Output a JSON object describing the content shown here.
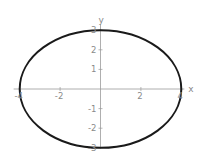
{
  "chart_data": {
    "type": "line",
    "title": "",
    "xlabel": "x",
    "ylabel": "y",
    "xlim": [
      -4,
      4
    ],
    "ylim": [
      -3,
      3
    ],
    "grid": false,
    "legend": null,
    "x_ticks": [
      -4,
      -2,
      2,
      4
    ],
    "x_tick_labels": [
      "-4",
      "-2",
      "2",
      "4"
    ],
    "y_ticks": [
      -3,
      -2,
      -1,
      1,
      2,
      3
    ],
    "y_tick_labels": [
      "-3",
      "-2",
      "-1",
      "1",
      "2",
      "3"
    ],
    "series": [
      {
        "name": "ellipse",
        "description": "x^2/16 + y^2/9 = 1",
        "semi_axis_x": 4,
        "semi_axis_y": 3,
        "center": [
          0,
          0
        ],
        "color": "#1a1a1a"
      }
    ]
  },
  "style": {
    "axis_color": "#9a9a9a",
    "curve_color": "#1a1a1a",
    "label_color": "#8a8a8a"
  }
}
